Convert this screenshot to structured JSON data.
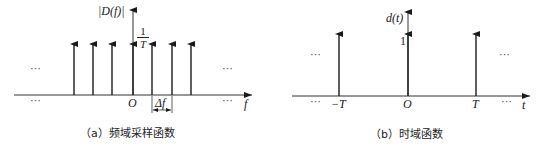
{
  "panel_a": {
    "y_label": "|D(f)|",
    "x_label": "f",
    "origin_label": "O",
    "amplitude_num": "1",
    "amplitude_den": "T",
    "spacing_label": "Δf",
    "ellipsis": "···",
    "caption": "（a）频域采样函数",
    "impulse_count": 7
  },
  "panel_b": {
    "y_label": "d(t)",
    "x_label": "t",
    "origin_label": "O",
    "neg_label": "−T",
    "pos_label": "T",
    "amplitude_label": "1",
    "ellipsis": "···",
    "caption": "（b）时域函数",
    "impulse_count": 3
  },
  "colors": {
    "line": "#1a1a1a",
    "background": "#ffffff"
  }
}
